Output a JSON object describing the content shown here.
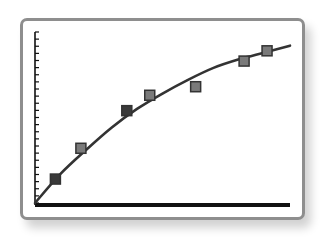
{
  "chart_data": {
    "type": "scatter",
    "title": "",
    "xlabel": "",
    "ylabel": "",
    "xlim": [
      0,
      100
    ],
    "ylim": [
      0,
      100
    ],
    "grid": false,
    "legend": null,
    "y_tick_count": 24,
    "tick_labels_visible": false,
    "series": [
      {
        "name": "observations",
        "kind": "scatter",
        "marker": "square",
        "points": [
          {
            "x": 8,
            "y": 14
          },
          {
            "x": 18,
            "y": 32
          },
          {
            "x": 36,
            "y": 54
          },
          {
            "x": 45,
            "y": 63
          },
          {
            "x": 63,
            "y": 68
          },
          {
            "x": 82,
            "y": 83
          },
          {
            "x": 91,
            "y": 89
          }
        ]
      },
      {
        "name": "fit",
        "kind": "line",
        "shape": "concave saturating curve",
        "points": [
          {
            "x": 0,
            "y": 0
          },
          {
            "x": 10,
            "y": 17
          },
          {
            "x": 20,
            "y": 31
          },
          {
            "x": 30,
            "y": 44
          },
          {
            "x": 40,
            "y": 55
          },
          {
            "x": 50,
            "y": 64
          },
          {
            "x": 60,
            "y": 72
          },
          {
            "x": 70,
            "y": 79
          },
          {
            "x": 80,
            "y": 84
          },
          {
            "x": 90,
            "y": 88
          },
          {
            "x": 100,
            "y": 92
          }
        ]
      }
    ]
  },
  "style": {
    "card_border": "#8e8e8e",
    "axis_color": "#111111",
    "curve_color": "#333333",
    "marker_fill": "#7a7a7a",
    "marker_fill_dark": "#3a3a3a",
    "marker_stroke": "#333333"
  }
}
